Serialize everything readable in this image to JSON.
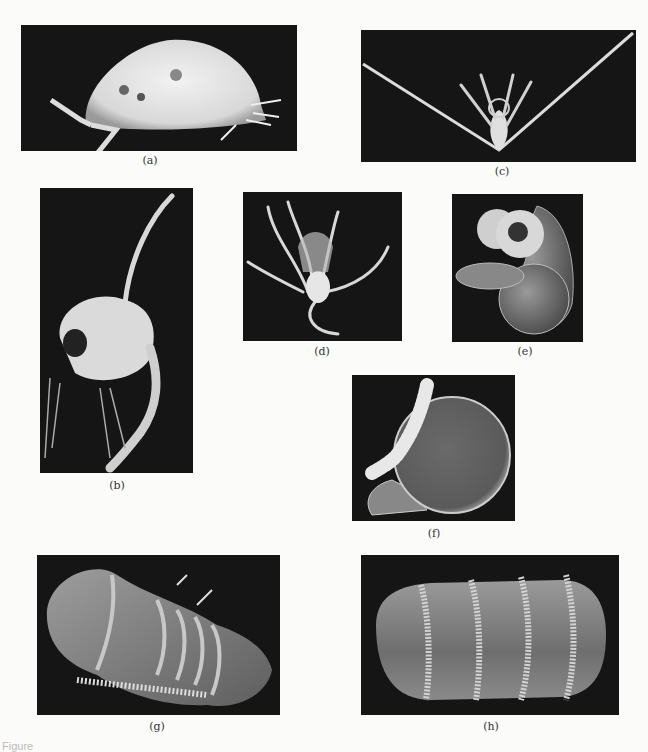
{
  "figure": {
    "panels": [
      {
        "id": "a",
        "label": "(a)",
        "description": "ostracod-like crustacean, lateral view, bright on black"
      },
      {
        "id": "b",
        "label": "(b)",
        "description": "copepod/larval crustacean with long dorsal spine"
      },
      {
        "id": "c",
        "label": "(c)",
        "description": "larva with two long outstretched arms"
      },
      {
        "id": "d",
        "label": "(d)",
        "description": "tentacled larva on black"
      },
      {
        "id": "e",
        "label": "(e)",
        "description": "veliger larva with ciliated velum and coiled shell (SEM)"
      },
      {
        "id": "f",
        "label": "(f)",
        "description": "veliger larva with ciliated band and round shell (SEM)"
      },
      {
        "id": "g",
        "label": "(g)",
        "description": "segmented larva with ciliary bands (SEM)"
      },
      {
        "id": "h",
        "label": "(h)",
        "description": "barrel-shaped larva with ciliated rings (SEM)"
      }
    ],
    "caption_partial": "Figure"
  },
  "colors": {
    "background": "#fbfbfa",
    "panel_bg": "#151515",
    "specimen_light": "#e8e8e8",
    "sem_gray": "#8a8a8a"
  }
}
